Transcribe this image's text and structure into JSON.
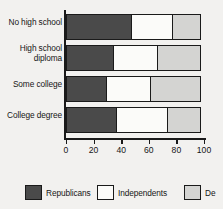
{
  "chart_data": {
    "type": "bar",
    "orientation": "horizontal",
    "stacked": true,
    "title": "",
    "xlabel": "",
    "ylabel": "",
    "xlim": [
      0,
      100
    ],
    "grid": false,
    "legend_position": "bottom",
    "categories": [
      "No high school",
      "High school diploma",
      "Some college",
      "College degree"
    ],
    "tick_values": [
      0,
      20,
      40,
      60,
      80,
      100
    ],
    "tick_labels": [
      "0",
      "20",
      "40",
      "60",
      "80",
      "100"
    ],
    "series": [
      {
        "name": "Republicans",
        "color": "#4a4a4a",
        "values": [
          48,
          35,
          30,
          37
        ]
      },
      {
        "name": "Independents",
        "color": "#fbfbf9",
        "values": [
          31,
          33,
          33,
          38
        ]
      },
      {
        "name": "Democrats",
        "color": "#d4d4d2",
        "values": [
          21,
          32,
          37,
          25
        ]
      }
    ]
  },
  "categories_display": [
    {
      "line1": "No high school",
      "line2": ""
    },
    {
      "line1": "High school",
      "line2": "diploma"
    },
    {
      "line1": "Some college",
      "line2": ""
    },
    {
      "line1": "College degree",
      "line2": ""
    }
  ],
  "legend": {
    "items": [
      {
        "label": "Republicans",
        "color": "#4a4a4a"
      },
      {
        "label": "Independents",
        "color": "#fbfbf9"
      },
      {
        "label": "De",
        "color": "#d4d4d2"
      }
    ]
  }
}
